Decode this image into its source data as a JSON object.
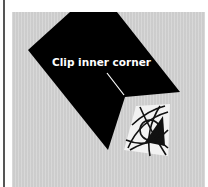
{
  "illustration": {
    "callout": "Clip inner corner",
    "colors": {
      "background": "#d3d3d3",
      "fabric_shape": "#000000",
      "callout_text": "#ffffff",
      "border_rule": "#555555"
    }
  }
}
